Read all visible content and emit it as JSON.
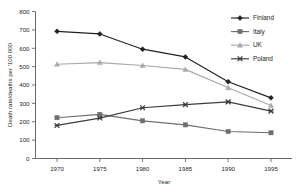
{
  "chart_data": {
    "type": "line",
    "title": "",
    "xlabel": "Year",
    "ylabel": "Death rate/deaths per '100 000",
    "x": [
      1970,
      1975,
      1980,
      1985,
      1990,
      1995
    ],
    "xticklabels": [
      "1970",
      "1975",
      "1980",
      "1985",
      "1990",
      "1995"
    ],
    "yticks": [
      0,
      100,
      200,
      300,
      400,
      500,
      600,
      700,
      800
    ],
    "yticklabels": [
      "0",
      "100",
      "200",
      "300",
      "400",
      "500",
      "600",
      "700",
      "800"
    ],
    "xlim": [
      1967.5,
      1997.5
    ],
    "ylim": [
      0,
      800
    ],
    "grid": false,
    "legend_position": "top-right",
    "series": [
      {
        "name": "Finland",
        "marker": "diamond",
        "color": "#231f20",
        "values": [
          692,
          678,
          595,
          553,
          418,
          330
        ]
      },
      {
        "name": "Italy",
        "marker": "square",
        "color": "#6d6e70",
        "values": [
          222,
          240,
          205,
          183,
          147,
          140
        ]
      },
      {
        "name": "UK",
        "marker": "triangle",
        "color": "#a7a9ac",
        "values": [
          513,
          522,
          506,
          485,
          385,
          288
        ]
      },
      {
        "name": "Poland",
        "marker": "x-cross",
        "color": "#3b3b3d",
        "values": [
          180,
          220,
          276,
          293,
          308,
          258
        ]
      }
    ]
  },
  "axes": {
    "x_title": "Year",
    "y_title": "Death rate/deaths per '100 000"
  },
  "legend": {
    "items": [
      {
        "label": "Finland"
      },
      {
        "label": "Italy"
      },
      {
        "label": "UK"
      },
      {
        "label": "Poland"
      }
    ]
  },
  "yticklabels": {
    "t0": "0",
    "t1": "100",
    "t2": "200",
    "t3": "300",
    "t4": "400",
    "t5": "500",
    "t6": "600",
    "t7": "700",
    "t8": "800"
  },
  "xticklabels": {
    "t0": "1970",
    "t1": "1975",
    "t2": "1980",
    "t3": "1985",
    "t4": "1990",
    "t5": "1995"
  }
}
